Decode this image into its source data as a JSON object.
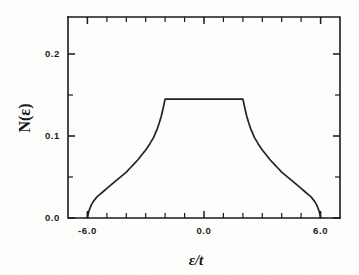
{
  "figure": {
    "background_color": "#fdfdfc",
    "ink_color": "#1a1a1a",
    "curve_color": "#232323"
  },
  "axes": {
    "x_title": "ε/t",
    "y_title": "N(ε)",
    "x_tick_labels": [
      "-6.0",
      "0.0",
      "6.0"
    ],
    "y_tick_labels": [
      "0.0",
      "0.1",
      "0.2"
    ]
  },
  "chart_data": {
    "type": "line",
    "title": "",
    "xlabel": "ε/t",
    "ylabel": "N(ε)",
    "xlim": [
      -7.0,
      7.0
    ],
    "ylim": [
      0.0,
      0.245
    ],
    "grid": false,
    "legend": null,
    "x_major_ticks": [
      -6.0,
      0.0,
      6.0
    ],
    "x_minor_ticks": [
      -5.0,
      -4.0,
      -3.0,
      -2.0,
      -1.0,
      1.0,
      2.0,
      3.0,
      4.0,
      5.0
    ],
    "y_major_ticks": [
      0.0,
      0.1,
      0.2
    ],
    "y_minor_ticks": [
      0.05,
      0.15
    ],
    "band_edges": [
      -6.0,
      6.0
    ],
    "plateau_range": [
      -2.0,
      2.0
    ],
    "plateau_value": 0.145,
    "series": [
      {
        "name": "N(ε)",
        "x": [
          -6.0,
          -5.95,
          -5.9,
          -5.8,
          -5.7,
          -5.6,
          -5.5,
          -5.4,
          -5.2,
          -5.0,
          -4.8,
          -4.6,
          -4.4,
          -4.2,
          -4.0,
          -3.8,
          -3.6,
          -3.4,
          -3.2,
          -3.0,
          -2.8,
          -2.6,
          -2.4,
          -2.3,
          -2.2,
          -2.1,
          -2.05,
          -2.0,
          -1.5,
          -1.0,
          -0.5,
          0.0,
          0.5,
          1.0,
          1.5,
          2.0,
          2.05,
          2.1,
          2.2,
          2.3,
          2.4,
          2.6,
          2.8,
          3.0,
          3.2,
          3.4,
          3.6,
          3.8,
          4.0,
          4.2,
          4.4,
          4.6,
          4.8,
          5.0,
          5.2,
          5.4,
          5.5,
          5.6,
          5.7,
          5.8,
          5.9,
          5.95,
          6.0
        ],
        "y": [
          0.0,
          0.006,
          0.01,
          0.016,
          0.02,
          0.023,
          0.026,
          0.028,
          0.032,
          0.036,
          0.04,
          0.044,
          0.048,
          0.052,
          0.056,
          0.061,
          0.066,
          0.071,
          0.077,
          0.083,
          0.09,
          0.098,
          0.109,
          0.116,
          0.124,
          0.134,
          0.14,
          0.145,
          0.145,
          0.145,
          0.145,
          0.145,
          0.145,
          0.145,
          0.145,
          0.145,
          0.14,
          0.134,
          0.124,
          0.116,
          0.109,
          0.098,
          0.09,
          0.083,
          0.077,
          0.071,
          0.066,
          0.061,
          0.056,
          0.052,
          0.048,
          0.044,
          0.04,
          0.036,
          0.032,
          0.028,
          0.026,
          0.023,
          0.02,
          0.016,
          0.01,
          0.006,
          0.0
        ]
      }
    ]
  }
}
